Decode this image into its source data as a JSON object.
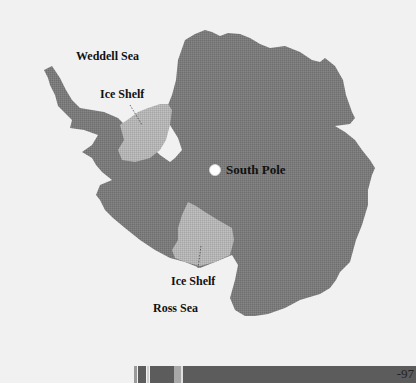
{
  "map": {
    "title": "Antarctica",
    "labels": {
      "weddell_sea": "Weddell Sea",
      "ice_shelf_upper": "Ice Shelf",
      "south_pole": "South Pole",
      "ice_shelf_lower": "Ice Shelf",
      "ross_sea": "Ross Sea"
    },
    "colors": {
      "background": "#f1f1f1",
      "land": "#7b7b7b",
      "ice_shelf": "#b4b4b4",
      "pole_marker": "#ffffff",
      "bar_dark": "#5c5c5c",
      "bar_light": "#a8a8a8"
    }
  },
  "footer": {
    "page_number": "-97"
  }
}
